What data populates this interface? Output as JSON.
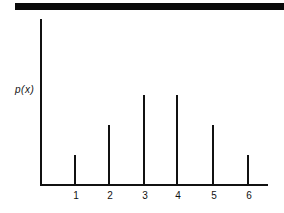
{
  "chart_data": {
    "type": "bar",
    "style": "stem",
    "title": "",
    "xlabel": "",
    "ylabel": "p(x)",
    "categories": [
      "1",
      "2",
      "3",
      "4",
      "5",
      "6"
    ],
    "values": [
      1,
      2,
      3,
      3,
      2,
      1
    ],
    "ylim": [
      0,
      5.5
    ],
    "grid": false,
    "legend": null
  },
  "layout": {
    "bar_x": [
      75,
      109,
      144,
      177,
      213,
      248
    ],
    "axis_y": 185,
    "px_per_unit": 30
  }
}
